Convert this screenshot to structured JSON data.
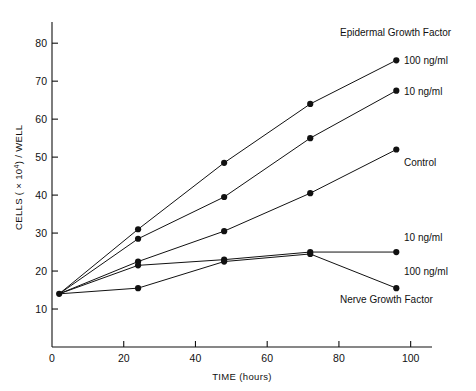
{
  "chart_data": {
    "type": "line",
    "title": "",
    "xlabel": "TIME (hours)",
    "ylabel": "CELLS ( × 10⁴) / WELL",
    "ylabel_parts": {
      "pre": "CELLS ( × 10",
      "sup": "4",
      "post": ") / WELL"
    },
    "xlim": [
      0,
      104
    ],
    "ylim": [
      0,
      84
    ],
    "xticks": [
      0,
      20,
      40,
      60,
      80,
      100
    ],
    "yticks": [
      10,
      20,
      30,
      40,
      50,
      60,
      70,
      80
    ],
    "xtick_labels": [
      "0",
      "20",
      "40",
      "60",
      "80",
      "100"
    ],
    "ytick_labels": [
      "10",
      "20",
      "30",
      "40",
      "50",
      "60",
      "70",
      "80"
    ],
    "grid": false,
    "legend_position": "inline-annotations",
    "x": [
      2,
      24,
      48,
      72,
      96
    ],
    "series": [
      {
        "name": "Epidermal Growth Factor 100 ng/ml",
        "group": "Epidermal Growth Factor",
        "dose": "100 ng/ml",
        "values": [
          14,
          31,
          48.5,
          64,
          75.5
        ]
      },
      {
        "name": "Epidermal Growth Factor 10 ng/ml",
        "group": "Epidermal Growth Factor",
        "dose": "10 ng/ml",
        "values": [
          14,
          28.5,
          39.5,
          55,
          67.5
        ]
      },
      {
        "name": "Control",
        "group": "Control",
        "dose": "",
        "values": [
          14,
          22.5,
          30.5,
          40.5,
          52
        ]
      },
      {
        "name": "Nerve Growth Factor 10 ng/ml",
        "group": "Nerve Growth Factor",
        "dose": "10 ng/ml",
        "values": [
          14,
          21.5,
          23,
          25,
          25
        ]
      },
      {
        "name": "Nerve Growth Factor 100 ng/ml",
        "group": "Nerve Growth Factor",
        "dose": "100 ng/ml",
        "values": [
          14,
          15.5,
          22.5,
          24.5,
          15.5
        ]
      }
    ],
    "annotations": [
      {
        "key": "egf_title",
        "text": "Epidermal Growth Factor",
        "x": 340,
        "y": 36,
        "anchor": "start"
      },
      {
        "key": "egf_100",
        "text": "100 ng/ml",
        "x": 404,
        "y": 64,
        "anchor": "start"
      },
      {
        "key": "egf_10",
        "text": "10 ng/ml",
        "x": 404,
        "y": 95,
        "anchor": "start"
      },
      {
        "key": "control",
        "text": "Control",
        "x": 404,
        "y": 166,
        "anchor": "start"
      },
      {
        "key": "ngf_10",
        "text": "10 ng/ml",
        "x": 404,
        "y": 241,
        "anchor": "start"
      },
      {
        "key": "ngf_100",
        "text": "100 ng/ml",
        "x": 404,
        "y": 275,
        "anchor": "start"
      },
      {
        "key": "ngf_title",
        "text": "Nerve Growth Factor",
        "x": 340,
        "y": 303,
        "anchor": "start"
      }
    ]
  }
}
